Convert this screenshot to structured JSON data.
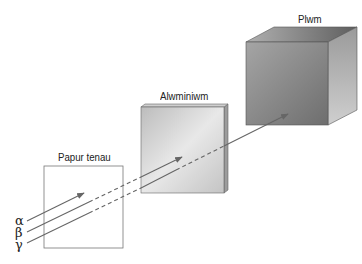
{
  "diagram": {
    "labels": {
      "paper": "Papur tenau",
      "aluminium": "Alwminiwm",
      "lead": "Plwm"
    },
    "radiation": [
      {
        "symbol": "α",
        "name": "alpha",
        "stops_at": "paper"
      },
      {
        "symbol": "β",
        "name": "beta",
        "stops_at": "aluminium"
      },
      {
        "symbol": "γ",
        "name": "gamma",
        "stops_at": "lead"
      }
    ],
    "colors": {
      "ray": "#666666",
      "outline": "#555555",
      "aluminium_face": "#d8d8d8",
      "lead_face": "#8a8a8a"
    }
  }
}
